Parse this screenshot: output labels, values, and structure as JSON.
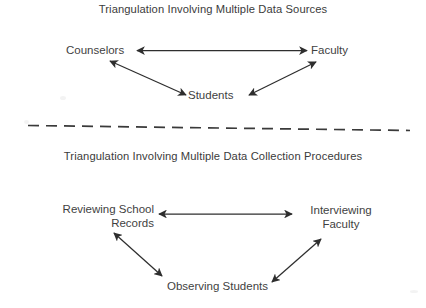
{
  "document": {
    "background_color": "#ffffff",
    "ink_color": "#3b3b3b",
    "arrow_color": "#2e2e2e"
  },
  "panels": [
    {
      "id": "multiple-data-sources",
      "title": "Triangulation Involving Multiple Data Sources",
      "nodes": [
        {
          "id": "counselors",
          "label": "Counselors"
        },
        {
          "id": "faculty",
          "label": "Faculty"
        },
        {
          "id": "students",
          "label": "Students"
        }
      ],
      "connections": [
        {
          "from": "counselors",
          "to": "faculty",
          "style": "double-headed"
        },
        {
          "from": "counselors",
          "to": "students",
          "style": "double-headed"
        },
        {
          "from": "faculty",
          "to": "students",
          "style": "double-headed"
        }
      ]
    },
    {
      "id": "multiple-data-collection-procedures",
      "title": "Triangulation Involving Multiple Data Collection Procedures",
      "nodes": [
        {
          "id": "reviewing-school-records",
          "label_line1": "Reviewing School",
          "label_line2": "Records"
        },
        {
          "id": "interviewing-faculty",
          "label_line1": "Interviewing",
          "label_line2": "Faculty"
        },
        {
          "id": "observing-students",
          "label": "Observing Students"
        }
      ],
      "connections": [
        {
          "from": "reviewing-school-records",
          "to": "interviewing-faculty",
          "style": "double-headed"
        },
        {
          "from": "reviewing-school-records",
          "to": "observing-students",
          "style": "double-headed"
        },
        {
          "from": "interviewing-faculty",
          "to": "observing-students",
          "style": "double-headed"
        }
      ]
    }
  ],
  "divider": {
    "style": "dashed",
    "orientation": "horizontal"
  }
}
